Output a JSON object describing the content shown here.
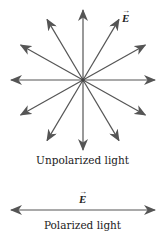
{
  "figure": {
    "unpolarized": {
      "center": [
        83,
        80
      ],
      "radius_x": 72,
      "radius_y": 70,
      "arrow_angles_deg": [
        0,
        30,
        60,
        90,
        120,
        150,
        180,
        210,
        240,
        270,
        300,
        330
      ],
      "vector_label": "E",
      "caption": "Unpolarized light"
    },
    "polarized": {
      "y": 210,
      "x_start": 11,
      "x_end": 155,
      "vector_label": "E",
      "caption": "Polarized light"
    },
    "colors": {
      "arrow": "#555555",
      "text": "#222222"
    }
  }
}
